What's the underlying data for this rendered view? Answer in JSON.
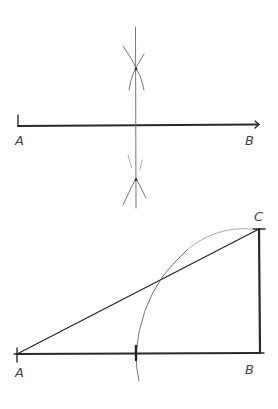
{
  "diagram": {
    "title": "",
    "figures": [
      {
        "name": "perpendicular-bisector-construction",
        "points": {
          "A": {
            "label": "A",
            "x": 18,
            "y": 125
          },
          "B": {
            "label": "B",
            "x": 259,
            "y": 125
          }
        },
        "segments": [
          {
            "from": "A",
            "to": "B",
            "style": "heavy"
          }
        ],
        "bisector": {
          "x": 136,
          "y_top": 27,
          "y_bottom": 208
        },
        "arc_intersections": [
          {
            "x": 136,
            "y": 69
          },
          {
            "x": 136,
            "y": 180
          }
        ]
      },
      {
        "name": "right-triangle-arc-construction",
        "points": {
          "A": {
            "label": "A",
            "x": 17,
            "y": 354
          },
          "B": {
            "label": "B",
            "x": 260,
            "y": 353
          },
          "C": {
            "label": "C",
            "x": 259,
            "y": 229
          }
        },
        "segments": [
          {
            "from": "A",
            "to": "B",
            "style": "heavy"
          },
          {
            "from": "B",
            "to": "C",
            "style": "heavy"
          },
          {
            "from": "A",
            "to": "C",
            "style": "mid"
          }
        ],
        "arc": {
          "center": "A",
          "through": "C",
          "intersects_hypotenuse": {
            "x": 161,
            "y": 278
          },
          "intersects_base": {
            "x": 136,
            "y": 353
          }
        }
      }
    ]
  },
  "labels": {
    "top_a": "A",
    "top_b": "B",
    "bottom_a": "A",
    "bottom_b": "B",
    "bottom_c": "C"
  }
}
